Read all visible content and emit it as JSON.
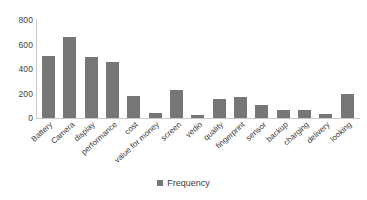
{
  "chart_data": {
    "type": "bar",
    "title": "",
    "xlabel": "",
    "ylabel": "",
    "ylim": [
      0,
      800
    ],
    "yticks": [
      0,
      200,
      400,
      600,
      800
    ],
    "grid": false,
    "legend_position": "bottom",
    "series_name": "Frequency",
    "bar_color": "#767676",
    "categories": [
      "Battery",
      "Camera",
      "display",
      "performance",
      "cost",
      "value for money",
      "screen",
      "vedio",
      "quality",
      "fingerprint",
      "sensor",
      "backup",
      "charging",
      "delivery",
      "looking"
    ],
    "values": [
      505,
      660,
      498,
      457,
      180,
      40,
      229,
      25,
      156,
      172,
      107,
      66,
      66,
      34,
      196
    ]
  },
  "legend": {
    "entries": [
      {
        "label": "Frequency",
        "color": "#767676",
        "marker": "square-marker"
      }
    ]
  },
  "axes": {
    "y_tick_labels": [
      "800",
      "600",
      "400",
      "200",
      "0"
    ]
  }
}
